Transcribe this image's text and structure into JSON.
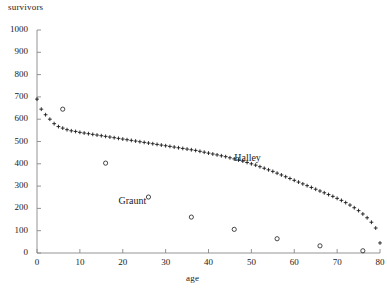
{
  "chart_data": {
    "type": "scatter",
    "title": "",
    "xlabel": "age",
    "ylabel": "survivors",
    "xlim": [
      0,
      80
    ],
    "ylim": [
      0,
      1000
    ],
    "xticks": [
      0,
      10,
      20,
      30,
      40,
      50,
      60,
      70,
      80
    ],
    "yticks": [
      0,
      100,
      200,
      300,
      400,
      500,
      600,
      700,
      800,
      900,
      1000
    ],
    "grid": false,
    "legend_position": "inline-annotations",
    "annotations": [
      {
        "text": "Halley",
        "x": 46,
        "y": 420
      },
      {
        "text": "Graunt",
        "x": 19,
        "y": 228
      }
    ],
    "series": [
      {
        "name": "Halley",
        "marker": "plus",
        "color": "#1a1a1a",
        "x": [
          0,
          1,
          2,
          3,
          4,
          5,
          6,
          7,
          8,
          9,
          10,
          11,
          12,
          13,
          14,
          15,
          16,
          17,
          18,
          19,
          20,
          21,
          22,
          23,
          24,
          25,
          26,
          27,
          28,
          29,
          30,
          31,
          32,
          33,
          34,
          35,
          36,
          37,
          38,
          39,
          40,
          41,
          42,
          43,
          44,
          45,
          46,
          47,
          48,
          49,
          50,
          51,
          52,
          53,
          54,
          55,
          56,
          57,
          58,
          59,
          60,
          61,
          62,
          63,
          64,
          65,
          66,
          67,
          68,
          69,
          70,
          71,
          72,
          73,
          74,
          75,
          76,
          77,
          78,
          79,
          80
        ],
        "y": [
          690,
          645,
          620,
          600,
          580,
          567,
          560,
          553,
          548,
          545,
          541,
          538,
          535,
          532,
          529,
          526,
          523,
          520,
          517,
          514,
          511,
          508,
          505,
          502,
          499,
          496,
          493,
          490,
          487,
          484,
          481,
          478,
          475,
          472,
          469,
          466,
          463,
          460,
          456,
          452,
          448,
          444,
          440,
          436,
          432,
          427,
          422,
          417,
          412,
          406,
          400,
          394,
          387,
          380,
          373,
          366,
          358,
          350,
          342,
          334,
          326,
          318,
          310,
          302,
          294,
          286,
          278,
          270,
          262,
          254,
          245,
          236,
          226,
          215,
          203,
          190,
          175,
          158,
          138,
          112,
          45
        ]
      },
      {
        "name": "Graunt",
        "marker": "circle",
        "color": "#1a1a1a",
        "x": [
          6,
          16,
          26,
          36,
          46,
          56,
          66,
          76
        ],
        "y": [
          645,
          403,
          251,
          161,
          106,
          64,
          32,
          10
        ]
      }
    ]
  }
}
